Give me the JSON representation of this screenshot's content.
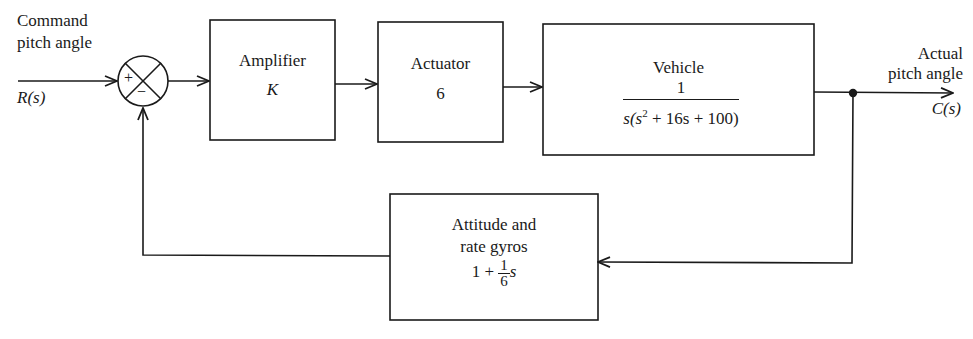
{
  "diagram": {
    "type": "control-system-block-diagram",
    "input": {
      "label_line1": "Command",
      "label_line2": "pitch angle",
      "signal": "R(s)"
    },
    "output": {
      "label_line1": "Actual",
      "label_line2": "pitch angle",
      "signal": "C(s)"
    },
    "summing_junction": {
      "plus_sign": "+",
      "minus_sign": "−"
    },
    "blocks": [
      {
        "id": "amplifier",
        "title": "Amplifier",
        "transfer_function": "K"
      },
      {
        "id": "actuator",
        "title": "Actuator",
        "transfer_function": "6"
      },
      {
        "id": "vehicle",
        "title": "Vehicle",
        "numerator": "1",
        "denominator_prefix": "s(s",
        "denominator_exp": "2",
        "denominator_suffix": " + 16s + 100)"
      },
      {
        "id": "gyros",
        "title_line1": "Attitude and",
        "title_line2": "rate gyros",
        "tf_prefix": "1 + ",
        "tf_frac_num": "1",
        "tf_frac_den": "6",
        "tf_suffix": "s"
      }
    ],
    "connections": [
      {
        "from": "R(s)",
        "to": "summing_junction",
        "sign": "+"
      },
      {
        "from": "summing_junction",
        "to": "amplifier"
      },
      {
        "from": "amplifier",
        "to": "actuator"
      },
      {
        "from": "actuator",
        "to": "vehicle"
      },
      {
        "from": "vehicle",
        "to": "C(s)"
      },
      {
        "from": "C(s)",
        "to": "gyros",
        "note": "pick-off point"
      },
      {
        "from": "gyros",
        "to": "summing_junction",
        "sign": "−"
      }
    ]
  }
}
